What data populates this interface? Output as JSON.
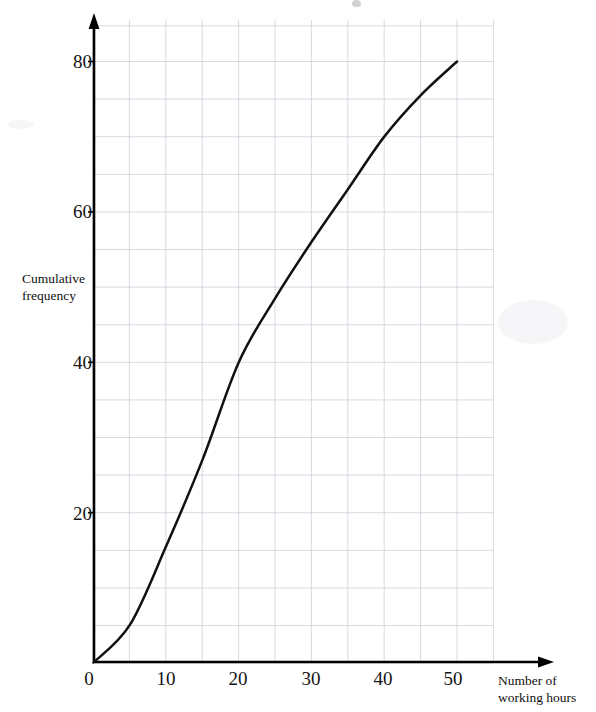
{
  "chart_data": {
    "type": "line",
    "title": "",
    "xlabel": "Number of working hours",
    "ylabel": "Cumulative frequency",
    "xlim": [
      0,
      55
    ],
    "ylim": [
      0,
      85
    ],
    "grid": true,
    "grid_step_x": 5,
    "grid_step_y": 10,
    "legend": "none",
    "x_tick_labels": [
      "0",
      "10",
      "20",
      "30",
      "40",
      "50"
    ],
    "x_tick_values": [
      0,
      10,
      20,
      30,
      40,
      50
    ],
    "y_tick_labels": [
      "20",
      "40",
      "60",
      "80"
    ],
    "y_tick_values": [
      20,
      40,
      60,
      80
    ],
    "series": [
      {
        "name": "Cumulative frequency",
        "color": "#111111",
        "x": [
          0,
          5,
          10,
          15,
          20,
          25,
          30,
          35,
          40,
          45,
          50
        ],
        "values": [
          0,
          5,
          15.5,
          27,
          40,
          48.5,
          56,
          63,
          70,
          75.5,
          80
        ]
      }
    ],
    "annotations": []
  },
  "axes": {
    "y_title_line1": "Cumulative",
    "y_title_line2": "frequency",
    "x_title_line1": "Number of",
    "x_title_line2": "working hours",
    "origin_label": "0"
  },
  "colors": {
    "curve": "#111111",
    "axis": "#000000",
    "grid": "#c9c9d6",
    "background": "#ffffff",
    "text": "#141414"
  }
}
